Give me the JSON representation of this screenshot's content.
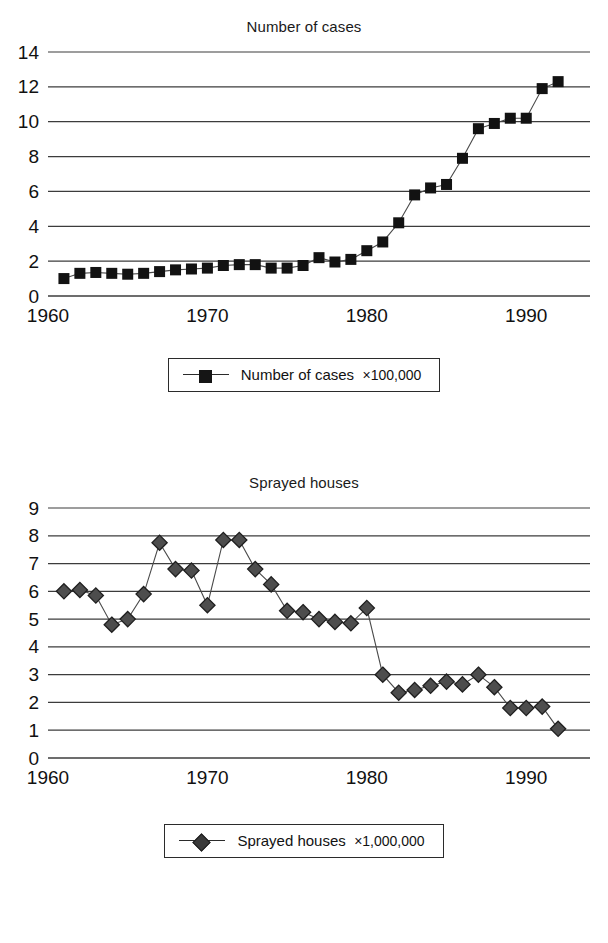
{
  "charts": [
    {
      "id": "cases",
      "title": "Number of cases",
      "legend_label": "Number of cases",
      "legend_multiplier": "×100,000",
      "marker": "square",
      "chart_data": {
        "type": "line",
        "title": "Number of cases",
        "xlabel": "",
        "ylabel": "",
        "xlim": [
          1960,
          1994
        ],
        "ylim": [
          0,
          14
        ],
        "ytick_step": 2,
        "yticks": [
          0,
          2,
          4,
          6,
          8,
          10,
          12,
          14
        ],
        "xticks": [
          1960,
          1970,
          1980,
          1990
        ],
        "xticklabels": [
          "1960",
          "1970",
          "1980",
          "1990"
        ],
        "grid": "horizontal",
        "legend_position": "below-center",
        "series_name": "Number of cases ×100,000",
        "units": "×100,000",
        "x": [
          1961,
          1962,
          1963,
          1964,
          1965,
          1966,
          1967,
          1968,
          1969,
          1970,
          1971,
          1972,
          1973,
          1974,
          1975,
          1976,
          1977,
          1978,
          1979,
          1980,
          1981,
          1982,
          1983,
          1984,
          1985,
          1986,
          1987,
          1988,
          1989,
          1990,
          1991,
          1992
        ],
        "values": [
          1.0,
          1.3,
          1.35,
          1.3,
          1.25,
          1.3,
          1.4,
          1.5,
          1.55,
          1.6,
          1.75,
          1.8,
          1.8,
          1.6,
          1.6,
          1.75,
          2.2,
          1.95,
          2.1,
          2.6,
          3.1,
          4.2,
          5.8,
          6.2,
          6.4,
          7.9,
          9.6,
          9.9,
          10.2,
          10.2,
          11.9,
          12.3,
          12.0
        ]
      }
    },
    {
      "id": "sprayed",
      "title": "Sprayed houses",
      "legend_label": "Sprayed houses",
      "legend_multiplier": "×1,000,000",
      "marker": "diamond",
      "chart_data": {
        "type": "line",
        "title": "Sprayed houses",
        "xlabel": "",
        "ylabel": "",
        "xlim": [
          1960,
          1994
        ],
        "ylim": [
          0,
          9
        ],
        "ytick_step": 1,
        "yticks": [
          0,
          1,
          2,
          3,
          4,
          5,
          6,
          7,
          8,
          9
        ],
        "xticks": [
          1960,
          1970,
          1980,
          1990
        ],
        "xticklabels": [
          "1960",
          "1970",
          "1980",
          "1990"
        ],
        "grid": "horizontal",
        "legend_position": "below-center",
        "series_name": "Sprayed houses ×1,000,000",
        "units": "×1,000,000",
        "x": [
          1961,
          1962,
          1963,
          1964,
          1965,
          1966,
          1967,
          1968,
          1969,
          1970,
          1971,
          1972,
          1973,
          1974,
          1975,
          1976,
          1977,
          1978,
          1979,
          1980,
          1981,
          1982,
          1983,
          1984,
          1985,
          1986,
          1987,
          1988,
          1989,
          1990,
          1991,
          1992,
          1993
        ],
        "values": [
          6.0,
          6.05,
          5.85,
          4.8,
          5.0,
          5.9,
          7.75,
          6.8,
          6.75,
          5.5,
          7.85,
          7.85,
          6.8,
          6.25,
          5.3,
          5.25,
          5.0,
          4.9,
          4.85,
          5.4,
          3.0,
          2.35,
          2.45,
          2.6,
          2.75,
          2.65,
          3.0,
          2.55,
          1.8,
          1.8,
          1.85,
          1.05
        ]
      }
    }
  ]
}
